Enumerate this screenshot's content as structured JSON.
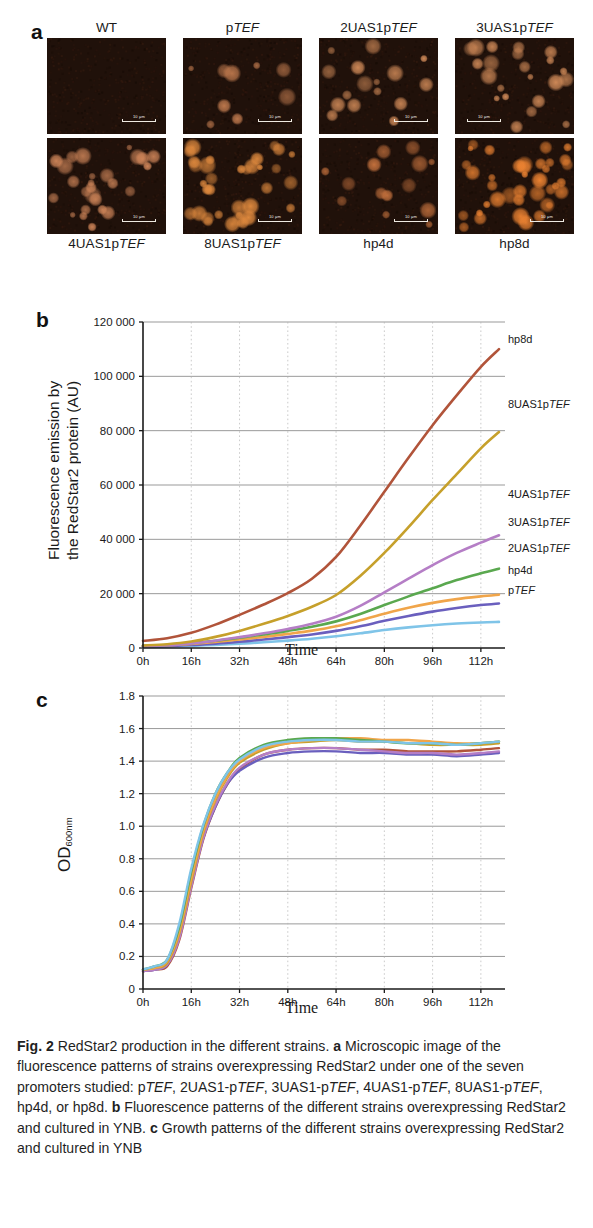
{
  "figure": {
    "label": "Fig. 2",
    "caption_parts": {
      "title": "RedStar2 production in the different strains. ",
      "a_letter": "a",
      "a_text": " Microscopic image of the fluorescence patterns of strains overexpressing RedStar2 under one of the seven promoters studied: p",
      "a_text2": "TEF",
      "a_text3": ", 2UAS1-p",
      "a_text4": "TEF",
      "a_text5": ", 3UAS1-p",
      "a_text6": "TEF",
      "a_text7": ", 4UAS1-p",
      "a_text8": "TEF",
      "a_text9": ", 8UAS1-p",
      "a_text10": "TEF",
      "a_text11": ", hp4d, or hp8d. ",
      "b_letter": "b",
      "b_text": " Fluorescence patterns of the different strains overexpressing RedStar2 and cultured in YNB. ",
      "c_letter": "c",
      "c_text": " Growth patterns of the different strains overexpressing RedStar2 and cultured in YNB"
    }
  },
  "panel_a": {
    "letter": "a",
    "scale_bar_text": "10 μm",
    "row1": [
      {
        "label_plain": "WT",
        "label_italic": "",
        "scale_side": "center"
      },
      {
        "label_plain": "p",
        "label_italic": "TEF",
        "scale_side": "center"
      },
      {
        "label_plain": "2UAS1p",
        "label_italic": "TEF",
        "scale_side": "center"
      },
      {
        "label_plain": "3UAS1p",
        "label_italic": "TEF",
        "scale_side": "left"
      }
    ],
    "row2": [
      {
        "label_plain": "4UAS1p",
        "label_italic": "TEF",
        "scale_side": "center"
      },
      {
        "label_plain": "8UAS1p",
        "label_italic": "TEF",
        "scale_side": "center"
      },
      {
        "label_plain": "hp4d",
        "label_italic": "",
        "scale_side": "center"
      },
      {
        "label_plain": "hp8d",
        "label_italic": "",
        "scale_side": "center"
      }
    ]
  },
  "panel_b": {
    "letter": "b",
    "ylabel_line1": "Fluorescence emission by",
    "ylabel_line2": "the RedStar2 protein (AU)",
    "xlabel": "Time"
  },
  "panel_c": {
    "letter": "c",
    "ylabel_main": "OD",
    "ylabel_sub": "600nm",
    "xlabel": "Time"
  },
  "chart_data": [
    {
      "id": "fluorescence",
      "type": "line",
      "title": "",
      "xlabel": "Time",
      "ylabel": "Fluorescence emission by the RedStar2 protein (AU)",
      "xticklabels": [
        "0h",
        "16h",
        "32h",
        "48h",
        "64h",
        "80h",
        "96h",
        "112h"
      ],
      "x": [
        0,
        16,
        32,
        48,
        64,
        80,
        96,
        112
      ],
      "xlim": [
        0,
        120
      ],
      "ylim": [
        0,
        120000
      ],
      "yticks": [
        0,
        20000,
        40000,
        60000,
        80000,
        100000,
        120000
      ],
      "yticklabels": [
        "0",
        "20 000",
        "40 000",
        "60 000",
        "80 000",
        "100 000",
        "120 000"
      ],
      "grid": "horizontal-solid, vertical-dotted",
      "legend": "right-inline-labels",
      "series": [
        {
          "name": "hp8d",
          "color": "#b1543a",
          "x": [
            0,
            8,
            16,
            24,
            32,
            40,
            48,
            56,
            64,
            72,
            80,
            88,
            96,
            104,
            112,
            118
          ],
          "values": [
            2600,
            3600,
            5600,
            8600,
            12200,
            16000,
            20200,
            25500,
            33500,
            45000,
            57500,
            70000,
            82000,
            93000,
            103500,
            110000
          ]
        },
        {
          "name": "8UAS1pTEF",
          "color": "#c6a02b",
          "x": [
            0,
            8,
            16,
            24,
            32,
            40,
            48,
            56,
            64,
            72,
            80,
            88,
            96,
            104,
            112,
            118
          ],
          "values": [
            900,
            1400,
            2400,
            4100,
            6300,
            8900,
            11800,
            15200,
            19500,
            26500,
            35000,
            44500,
            54500,
            64000,
            73500,
            79500
          ]
        },
        {
          "name": "4UAS1pTEF",
          "color": "#b57ec6",
          "x": [
            0,
            8,
            16,
            24,
            32,
            40,
            48,
            56,
            64,
            72,
            80,
            88,
            96,
            104,
            112,
            118
          ],
          "values": [
            700,
            1000,
            1700,
            2700,
            4000,
            5400,
            7000,
            8900,
            11500,
            15500,
            20500,
            25500,
            30500,
            35000,
            38800,
            41500
          ]
        },
        {
          "name": "3UAS1pTEF",
          "color": "#5da martinez",
          "color_hex": "#5aa84f",
          "x": [
            0,
            8,
            16,
            24,
            32,
            40,
            48,
            56,
            64,
            72,
            80,
            88,
            96,
            104,
            112,
            118
          ],
          "values": [
            800,
            1100,
            1800,
            2700,
            3800,
            5000,
            6300,
            7800,
            9800,
            12500,
            15800,
            19000,
            22000,
            25000,
            27500,
            29200
          ]
        },
        {
          "name": "2UAS1pTEF",
          "color": "#f0a54a",
          "x": [
            0,
            8,
            16,
            24,
            32,
            40,
            48,
            56,
            64,
            72,
            80,
            88,
            96,
            104,
            112,
            118
          ],
          "values": [
            700,
            1000,
            1500,
            2200,
            3100,
            4100,
            5200,
            6400,
            8000,
            10200,
            12600,
            14800,
            16600,
            18000,
            19000,
            19600
          ]
        },
        {
          "name": "hp4d",
          "color": "#6a5fbe",
          "x": [
            0,
            8,
            16,
            24,
            32,
            40,
            48,
            56,
            64,
            72,
            80,
            88,
            96,
            104,
            112,
            118
          ],
          "values": [
            500,
            700,
            1100,
            1600,
            2300,
            3100,
            4000,
            5000,
            6300,
            8000,
            10000,
            11800,
            13400,
            14700,
            15800,
            16400
          ]
        },
        {
          "name": "pTEF",
          "color": "#7fc4e8",
          "x": [
            0,
            8,
            16,
            24,
            32,
            40,
            48,
            56,
            64,
            72,
            80,
            88,
            96,
            104,
            112,
            118
          ],
          "values": [
            400,
            550,
            800,
            1150,
            1600,
            2100,
            2700,
            3400,
            4300,
            5400,
            6600,
            7600,
            8400,
            9000,
            9400,
            9600
          ]
        }
      ]
    },
    {
      "id": "growth",
      "type": "line",
      "title": "",
      "xlabel": "Time",
      "ylabel": "OD600nm",
      "xticklabels": [
        "0h",
        "16h",
        "32h",
        "48h",
        "64h",
        "80h",
        "96h",
        "112h"
      ],
      "x": [
        0,
        16,
        32,
        48,
        64,
        80,
        96,
        112
      ],
      "xlim": [
        0,
        120
      ],
      "ylim": [
        0,
        1.8
      ],
      "yticks": [
        0,
        0.2,
        0.4,
        0.6,
        0.8,
        1.0,
        1.2,
        1.4,
        1.6,
        1.8
      ],
      "yticklabels": [
        "0",
        "0.2",
        "0.4",
        "0.6",
        "0.8",
        "1.0",
        "1.2",
        "1.4",
        "1.6",
        "1.8"
      ],
      "grid": "horizontal-solid, vertical-dotted",
      "legend": "none",
      "series": [
        {
          "name": "hp8d",
          "color": "#b1543a",
          "x": [
            0,
            4,
            8,
            12,
            16,
            20,
            24,
            28,
            32,
            40,
            48,
            56,
            64,
            72,
            80,
            88,
            96,
            104,
            112,
            118
          ],
          "values": [
            0.11,
            0.12,
            0.14,
            0.3,
            0.62,
            0.92,
            1.12,
            1.26,
            1.35,
            1.44,
            1.47,
            1.48,
            1.48,
            1.47,
            1.47,
            1.46,
            1.46,
            1.46,
            1.47,
            1.48
          ]
        },
        {
          "name": "8UAS1pTEF",
          "color": "#c6a02b",
          "x": [
            0,
            4,
            8,
            12,
            16,
            20,
            24,
            28,
            32,
            40,
            48,
            56,
            64,
            72,
            80,
            88,
            96,
            104,
            112,
            118
          ],
          "values": [
            0.12,
            0.13,
            0.16,
            0.34,
            0.66,
            0.96,
            1.16,
            1.3,
            1.39,
            1.47,
            1.51,
            1.52,
            1.53,
            1.52,
            1.52,
            1.51,
            1.5,
            1.5,
            1.5,
            1.51
          ]
        },
        {
          "name": "4UAS1pTEF",
          "color": "#b57ec6",
          "x": [
            0,
            4,
            8,
            12,
            16,
            20,
            24,
            28,
            32,
            40,
            48,
            56,
            64,
            72,
            80,
            88,
            96,
            104,
            112,
            118
          ],
          "values": [
            0.11,
            0.12,
            0.15,
            0.31,
            0.63,
            0.93,
            1.13,
            1.27,
            1.36,
            1.44,
            1.47,
            1.48,
            1.48,
            1.47,
            1.46,
            1.45,
            1.45,
            1.44,
            1.45,
            1.46
          ]
        },
        {
          "name": "3UAS1pTEF",
          "color": "#5aa84f",
          "x": [
            0,
            4,
            8,
            12,
            16,
            20,
            24,
            28,
            32,
            40,
            48,
            56,
            64,
            72,
            80,
            88,
            96,
            104,
            112,
            118
          ],
          "values": [
            0.12,
            0.14,
            0.18,
            0.38,
            0.72,
            1.0,
            1.2,
            1.33,
            1.42,
            1.5,
            1.53,
            1.54,
            1.54,
            1.53,
            1.52,
            1.51,
            1.51,
            1.5,
            1.51,
            1.52
          ]
        },
        {
          "name": "2UAS1pTEF",
          "color": "#f0a54a",
          "x": [
            0,
            4,
            8,
            12,
            16,
            20,
            24,
            28,
            32,
            40,
            48,
            56,
            64,
            72,
            80,
            88,
            96,
            104,
            112,
            118
          ],
          "values": [
            0.12,
            0.13,
            0.17,
            0.35,
            0.68,
            0.97,
            1.17,
            1.31,
            1.4,
            1.48,
            1.51,
            1.53,
            1.54,
            1.54,
            1.53,
            1.53,
            1.52,
            1.51,
            1.51,
            1.52
          ]
        },
        {
          "name": "hp4d",
          "color": "#6a5fbe",
          "x": [
            0,
            4,
            8,
            12,
            16,
            20,
            24,
            28,
            32,
            40,
            48,
            56,
            64,
            72,
            80,
            88,
            96,
            104,
            112,
            118
          ],
          "values": [
            0.11,
            0.12,
            0.15,
            0.32,
            0.64,
            0.93,
            1.12,
            1.26,
            1.34,
            1.42,
            1.45,
            1.46,
            1.46,
            1.45,
            1.45,
            1.44,
            1.44,
            1.43,
            1.44,
            1.45
          ]
        },
        {
          "name": "pTEF",
          "color": "#7fc4e8",
          "x": [
            0,
            4,
            8,
            12,
            16,
            20,
            24,
            28,
            32,
            40,
            48,
            56,
            64,
            72,
            80,
            88,
            96,
            104,
            112,
            118
          ],
          "values": [
            0.12,
            0.14,
            0.18,
            0.4,
            0.74,
            1.01,
            1.2,
            1.33,
            1.41,
            1.49,
            1.52,
            1.53,
            1.53,
            1.52,
            1.52,
            1.51,
            1.51,
            1.5,
            1.51,
            1.52
          ]
        }
      ]
    }
  ]
}
